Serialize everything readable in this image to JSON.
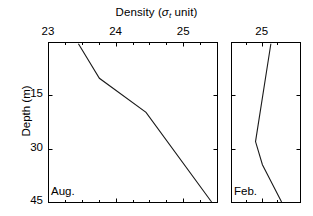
{
  "figure": {
    "title_prefix": "Density (",
    "title_symbol": "σ",
    "title_subscript": "t",
    "title_suffix": " unit)",
    "ylabel": "Depth (m)",
    "line_color": "#1a1a1a",
    "axis_color": "#000000",
    "background": "#ffffff"
  },
  "chart_data": {
    "type": "line",
    "title": "Density (σt unit)",
    "xlabel": "Density (σt unit)",
    "ylabel": "Depth (m)",
    "xaxis_position": "top",
    "yaxis_inverted": true,
    "grid": false,
    "legend": "none",
    "panels": [
      {
        "name": "Aug.",
        "label": "Aug.",
        "xlim": [
          23.0,
          25.5
        ],
        "ylim": [
          0.0,
          45.0
        ],
        "xticks": [
          23,
          24,
          25
        ],
        "xticklabels": [
          "23",
          "24",
          "25"
        ],
        "xminorticks": [
          23.25,
          23.5,
          23.75,
          24.25,
          24.5,
          24.75,
          25.25
        ],
        "yticks": [
          15,
          30,
          45
        ],
        "yticklabels": [
          "15",
          "30",
          "45"
        ],
        "series": [
          {
            "name": "August density profile",
            "density": [
              23.45,
              23.76,
              24.45,
              25.42
            ],
            "depth": [
              0.5,
              10.2,
              19.8,
              45.0
            ]
          }
        ]
      },
      {
        "name": "Feb.",
        "label": "Feb.",
        "xlim": [
          24.6,
          25.5
        ],
        "ylim": [
          0.0,
          45.0
        ],
        "xticks": [
          25
        ],
        "xticklabels": [
          "25"
        ],
        "xminorticks": [
          24.8,
          25.2
        ],
        "yticks": [
          15,
          30,
          45
        ],
        "yticklabels": [],
        "series": [
          {
            "name": "February density profile",
            "density": [
              25.12,
              24.92,
              25.01,
              25.26
            ],
            "depth": [
              0.5,
              28.0,
              34.5,
              45.0
            ]
          }
        ]
      }
    ]
  }
}
